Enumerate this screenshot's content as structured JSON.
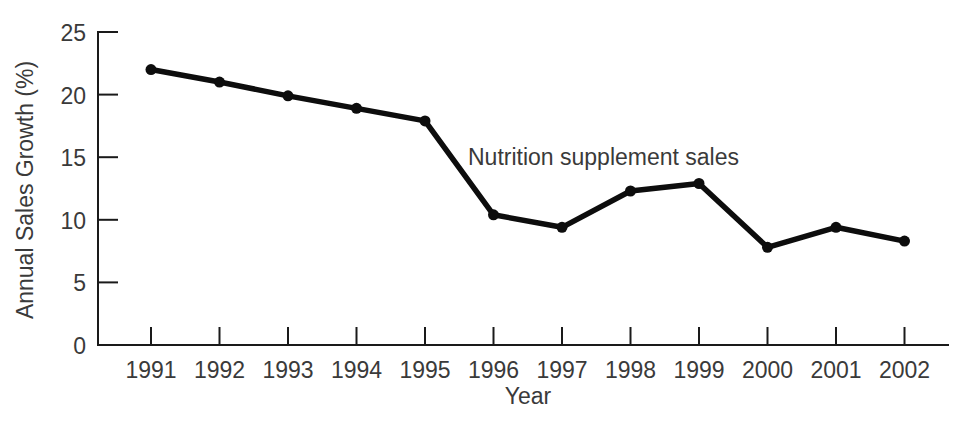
{
  "chart_data": {
    "type": "line",
    "title": "",
    "xlabel": "Year",
    "ylabel": "Annual Sales Growth (%)",
    "categories": [
      "1991",
      "1992",
      "1993",
      "1994",
      "1995",
      "1996",
      "1997",
      "1998",
      "1999",
      "2000",
      "2001",
      "2002"
    ],
    "series": [
      {
        "name": "Nutrition supplement sales",
        "values": [
          22.0,
          21.0,
          19.9,
          18.9,
          17.9,
          10.4,
          9.4,
          12.3,
          12.9,
          7.8,
          9.4,
          8.3
        ]
      }
    ],
    "annotations": [
      {
        "text": "Nutrition supplement sales",
        "x": "1996",
        "y": 14.6
      }
    ],
    "ylim": [
      0,
      25
    ],
    "yticks": [
      0,
      5,
      10,
      15,
      20,
      25
    ],
    "ytick_labels": [
      "0",
      "5",
      "10",
      "15",
      "20",
      "25"
    ],
    "xtick_labels": [
      "1991",
      "1992",
      "1993",
      "1994",
      "1995",
      "1996",
      "1997",
      "1998",
      "1999",
      "2000",
      "2001",
      "2002"
    ],
    "grid": false,
    "legend": "none",
    "marker": "filled-circle",
    "line_color": "#0d0d0d",
    "axis_color": "#1a1a1a",
    "text_color": "#3a3a3a",
    "background_color": "#ffffff"
  },
  "layout": {
    "plot_left": 98,
    "plot_right": 948,
    "plot_bottom": 345,
    "plot_top": 32,
    "first_tick_x": 151,
    "tick_spacing_x": 68.5,
    "y_axis_label_x": 33,
    "y_axis_label_y": 190,
    "x_axis_label_x": 528,
    "x_axis_label_y": 404,
    "annotation_x": 468,
    "annotation_y": 165
  }
}
